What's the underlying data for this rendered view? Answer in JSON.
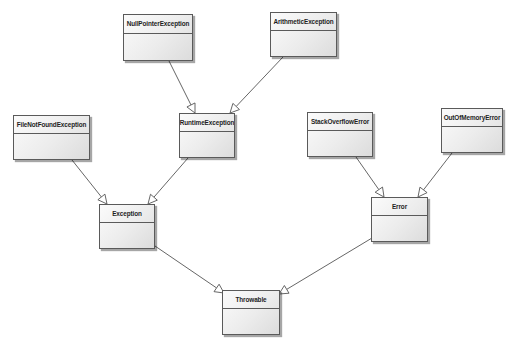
{
  "diagram": {
    "type": "uml-class-hierarchy",
    "colors": {
      "border": "#5a5a5a",
      "fill_light": "#fbfbfb",
      "fill_dark": "#dcdcdc",
      "edge": "#555555",
      "text": "#1e1e1e"
    },
    "classes": [
      {
        "id": "NullPointerException",
        "label": "NullPointerException",
        "x": 123,
        "y": 14,
        "w": 70,
        "h": 47
      },
      {
        "id": "ArithmeticException",
        "label": "ArithmeticException",
        "x": 270,
        "y": 12,
        "w": 67,
        "h": 45
      },
      {
        "id": "FileNotFoundException",
        "label": "FileNotFoundException",
        "x": 13,
        "y": 115,
        "w": 77,
        "h": 45
      },
      {
        "id": "RuntimeException",
        "label": "RuntimeException",
        "x": 179,
        "y": 113,
        "w": 56,
        "h": 45
      },
      {
        "id": "StackOverflowError",
        "label": "StackOverflowError",
        "x": 307,
        "y": 112,
        "w": 66,
        "h": 45
      },
      {
        "id": "OutOfMemoryError",
        "label": "OutOfMemoryError",
        "x": 441,
        "y": 108,
        "w": 62,
        "h": 45
      },
      {
        "id": "Exception",
        "label": "Exception",
        "x": 99,
        "y": 204,
        "w": 56,
        "h": 45
      },
      {
        "id": "Error",
        "label": "Error",
        "x": 371,
        "y": 197,
        "w": 57,
        "h": 45
      },
      {
        "id": "Throwable",
        "label": "Throwable",
        "x": 222,
        "y": 290,
        "w": 58,
        "h": 45
      }
    ],
    "edges": [
      {
        "from": "NullPointerException",
        "to": "RuntimeException",
        "kind": "generalization",
        "x1": 169,
        "y1": 61,
        "x2": 195,
        "y2": 113
      },
      {
        "from": "ArithmeticException",
        "to": "RuntimeException",
        "kind": "generalization",
        "x1": 283,
        "y1": 57,
        "x2": 230,
        "y2": 113
      },
      {
        "from": "FileNotFoundException",
        "to": "Exception",
        "kind": "generalization",
        "x1": 72,
        "y1": 160,
        "x2": 107,
        "y2": 204
      },
      {
        "from": "RuntimeException",
        "to": "Exception",
        "kind": "generalization",
        "x1": 188,
        "y1": 158,
        "x2": 148,
        "y2": 204
      },
      {
        "from": "StackOverflowError",
        "to": "Error",
        "kind": "generalization",
        "x1": 356,
        "y1": 157,
        "x2": 384,
        "y2": 197
      },
      {
        "from": "OutOfMemoryError",
        "to": "Error",
        "kind": "generalization",
        "x1": 452,
        "y1": 153,
        "x2": 418,
        "y2": 197
      },
      {
        "from": "Exception",
        "to": "Throwable",
        "kind": "generalization",
        "x1": 155,
        "y1": 246,
        "x2": 224,
        "y2": 293
      },
      {
        "from": "Error",
        "to": "Throwable",
        "kind": "generalization",
        "x1": 372,
        "y1": 238,
        "x2": 279,
        "y2": 294
      }
    ]
  }
}
